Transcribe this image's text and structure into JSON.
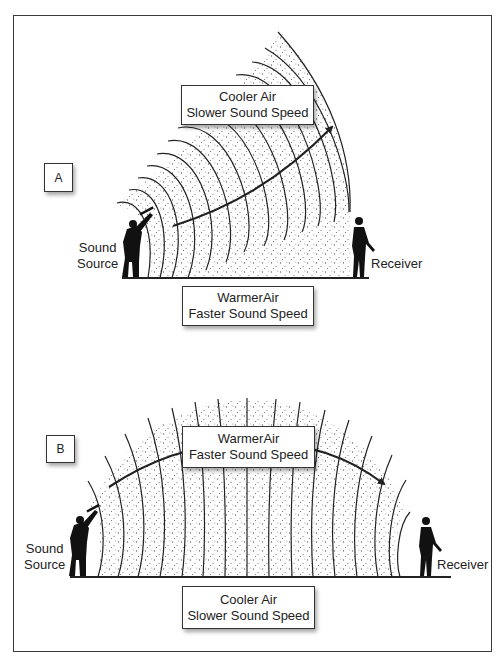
{
  "panels": [
    {
      "id": "A",
      "tag": "A",
      "upper_box": {
        "line1": "Cooler Air",
        "line2": "Slower Sound Speed"
      },
      "lower_box": {
        "line1": "WarmerAir",
        "line2": "Faster Sound Speed"
      },
      "source_label": {
        "line1": "Sound",
        "line2": "Source"
      },
      "receiver_label": "Receiver",
      "description": "Sound refracts upward away from receiver"
    },
    {
      "id": "B",
      "tag": "B",
      "upper_box": {
        "line1": "WarmerAir",
        "line2": "Faster Sound Speed"
      },
      "lower_box": {
        "line1": "Cooler Air",
        "line2": "Slower Sound Speed"
      },
      "source_label": {
        "line1": "Sound",
        "line2": "Source"
      },
      "receiver_label": "Receiver",
      "description": "Sound refracts downward toward receiver"
    }
  ],
  "colors": {
    "line": "#222222",
    "frame": "#3a3a3a",
    "stipple": "#555555",
    "background": "#ffffff"
  }
}
